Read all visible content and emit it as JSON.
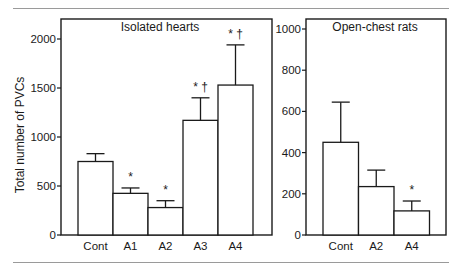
{
  "chart_data": [
    {
      "type": "bar",
      "title": "Isolated hearts",
      "xlabel": "",
      "ylabel": "Total number of PVCs",
      "ylim": [
        0,
        2200
      ],
      "yticks": [
        0,
        500,
        1000,
        1500,
        2000
      ],
      "grid": false,
      "legend": null,
      "categories": [
        "Cont",
        "A1",
        "A2",
        "A3",
        "A4"
      ],
      "values": [
        750,
        425,
        280,
        1170,
        1530
      ],
      "error_upper": [
        830,
        480,
        350,
        1400,
        1940
      ],
      "annotations": [
        "",
        "*",
        "*",
        "* †",
        "* †"
      ]
    },
    {
      "type": "bar",
      "title": "Open-chest rats",
      "xlabel": "",
      "ylabel": "",
      "ylim": [
        0,
        1050
      ],
      "yticks": [
        0,
        200,
        400,
        600,
        800,
        1000
      ],
      "grid": false,
      "legend": null,
      "categories": [
        "Cont",
        "A2",
        "A4"
      ],
      "values": [
        450,
        235,
        117
      ],
      "error_upper": [
        645,
        315,
        165
      ],
      "annotations": [
        "",
        "",
        "*"
      ]
    }
  ],
  "panels": {
    "left": {
      "title": "Isolated hearts",
      "ylabel": "Total number of PVCs"
    },
    "right": {
      "title": "Open-chest rats"
    }
  }
}
